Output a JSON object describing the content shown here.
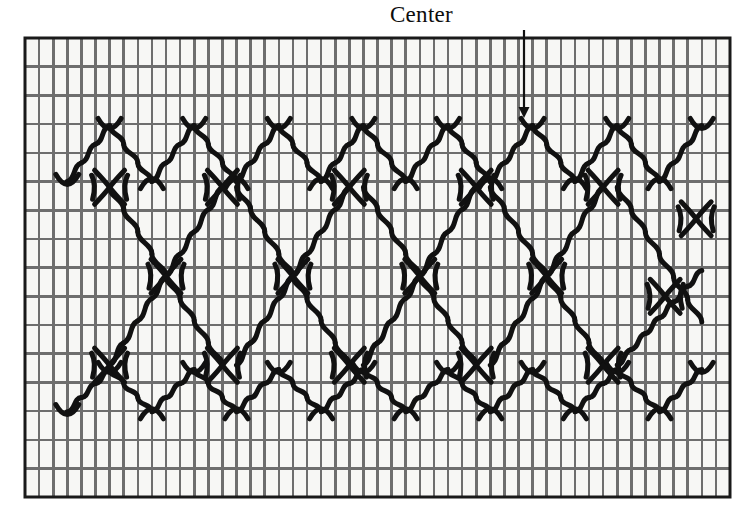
{
  "figure": {
    "kind": "needlework-stitch-chart",
    "annotation": {
      "label": "Center",
      "arrow": "down-arrow-icon",
      "arrow_target_x": 524,
      "arrow_top_y": 30,
      "arrow_tip_y": 118,
      "label_x": 524,
      "label_y": 18
    },
    "colors": {
      "background": "#ffffff",
      "canvas_fill": "#f7f7f5",
      "grid_line": "#6e6e6e",
      "grid_border": "#1a1a1a",
      "stitch": "#111111",
      "label_text": "#0d0d0d"
    },
    "grid": {
      "left": 25,
      "top": 38,
      "right": 730,
      "bottom": 497,
      "columns": 50,
      "rows": 16,
      "cell_width": 14.1,
      "cell_height": 28.7,
      "line_width": 2.6,
      "border_width": 3.0
    },
    "stitch_style": {
      "stroke_width": 5.0,
      "linecap": "round",
      "unit": "s-curve-arc",
      "description": "Curved cable stitches, each spanning one grid cell"
    },
    "pattern": {
      "chevron_rows": [
        {
          "name": "top-chevron-row",
          "baseline_row": 5,
          "peak_row": 3,
          "direction": "peaks-up"
        },
        {
          "name": "bottom-chevron-row",
          "baseline_row": 13,
          "peak_row": 12,
          "direction": "peaks-up"
        }
      ],
      "diagonal_lattice": {
        "description": "Chains of s-curve stitches descending and ascending one column per row, forming large diamonds",
        "crossing_nodes": "x-shaped four-arc clusters"
      }
    }
  }
}
